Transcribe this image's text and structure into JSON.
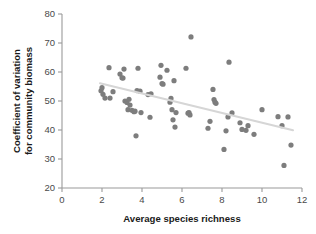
{
  "chart_data": {
    "type": "scatter",
    "title": "",
    "xlabel": "Average species richness",
    "ylabel": "Coefficient of variation for community biomass",
    "ylabel_lines": [
      "Coefficient of variation",
      "for community biomass"
    ],
    "xlim": [
      0,
      12
    ],
    "ylim": [
      20,
      80
    ],
    "xticks": [
      0,
      2,
      4,
      6,
      8,
      10,
      12
    ],
    "yticks": [
      20,
      30,
      40,
      50,
      60,
      70,
      80
    ],
    "xtick_labels": [
      "0",
      "2",
      "4",
      "6",
      "8",
      "10",
      "12"
    ],
    "ytick_labels": [
      "20",
      "30",
      "40",
      "50",
      "60",
      "70",
      "80"
    ],
    "grid": false,
    "legend": false,
    "point_color": "#7d7d7d",
    "point_radius": 2.6,
    "trend_color": "#d6d6d6",
    "series": [
      {
        "name": "plots",
        "x": [
          1.95,
          2.0,
          2.05,
          2.15,
          2.35,
          2.4,
          2.55,
          2.9,
          3.0,
          3.05,
          3.1,
          3.15,
          3.25,
          3.3,
          3.35,
          3.4,
          3.5,
          3.6,
          3.65,
          3.7,
          3.75,
          3.8,
          3.9,
          3.95,
          4.3,
          4.4,
          4.45,
          4.9,
          4.95,
          5.0,
          5.05,
          5.25,
          5.4,
          5.45,
          5.5,
          5.55,
          5.6,
          5.65,
          5.7,
          6.2,
          6.3,
          6.35,
          6.4,
          6.45,
          7.3,
          7.4,
          7.55,
          7.6,
          7.65,
          7.7,
          8.1,
          8.2,
          8.3,
          8.35,
          8.5,
          8.9,
          9.0,
          9.2,
          9.3,
          9.6,
          10.0,
          10.8,
          11.0,
          11.1,
          11.3,
          11.45
        ],
        "y": [
          53.5,
          54.6,
          52.3,
          51.0,
          61.5,
          51.0,
          53.2,
          59.3,
          58.0,
          57.9,
          61.0,
          50.0,
          49.5,
          47.0,
          50.6,
          48.6,
          46.8,
          46.3,
          46.5,
          38.0,
          53.6,
          61.3,
          53.4,
          46.0,
          52.2,
          44.4,
          52.5,
          58.2,
          62.3,
          56.0,
          55.8,
          60.6,
          49.6,
          50.9,
          47.0,
          43.5,
          57.0,
          41.0,
          46.0,
          61.3,
          45.8,
          46.0,
          45.2,
          72.1,
          40.6,
          43.0,
          54.0,
          50.5,
          49.6,
          49.2,
          33.3,
          39.7,
          44.5,
          63.4,
          45.9,
          42.5,
          40.2,
          39.9,
          41.5,
          38.5,
          47.0,
          44.6,
          41.5,
          27.8,
          44.5,
          34.8
        ]
      }
    ],
    "trend": {
      "type": "linear-fit",
      "x_start": 1.9,
      "y_start": 56.1,
      "x_end": 11.55,
      "y_end": 39.9
    }
  }
}
